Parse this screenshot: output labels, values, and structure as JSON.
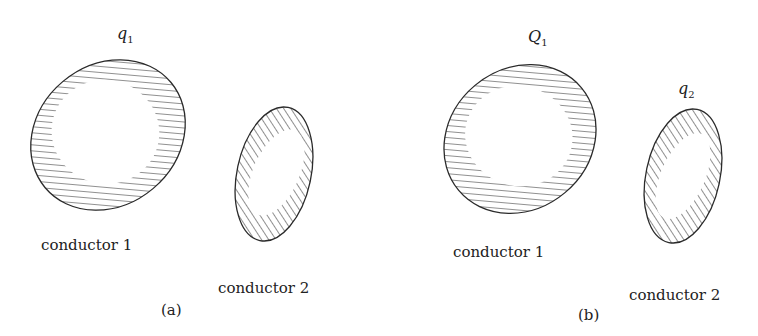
{
  "panels": [
    {
      "id": "a",
      "caption": "(a)",
      "charge_labels": [
        {
          "symbol": "q",
          "subscript": "1",
          "target": "conductor 1"
        }
      ],
      "conductors": [
        {
          "label": "conductor 1"
        },
        {
          "label": "conductor 2"
        }
      ]
    },
    {
      "id": "b",
      "caption": "(b)",
      "charge_labels": [
        {
          "symbol": "Q",
          "subscript": "1",
          "target": "conductor 1"
        },
        {
          "symbol": "q",
          "subscript": "2",
          "target": "conductor 2"
        }
      ],
      "conductors": [
        {
          "label": "conductor 1"
        },
        {
          "label": "conductor 2"
        }
      ]
    }
  ],
  "colors": {
    "stroke": "#2a2a2a",
    "hatch": "#333333",
    "background": "#ffffff"
  }
}
